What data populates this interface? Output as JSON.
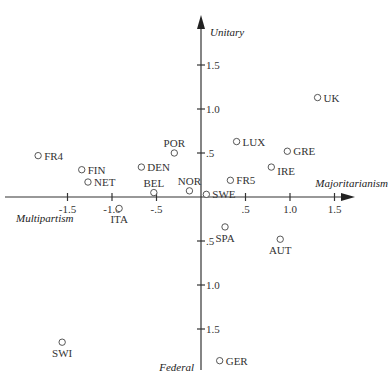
{
  "chart_data": {
    "type": "scatter",
    "title": "",
    "xlabel_positive": "Majoritarianism",
    "xlabel_negative": "Multipartism",
    "ylabel_positive": "Unitary",
    "ylabel_negative": "Federal",
    "xlim": [
      -1.9,
      1.7
    ],
    "ylim": [
      -1.95,
      2.05
    ],
    "grid": false,
    "legend": null,
    "x_ticks": [
      {
        "value": -1.5,
        "label": "-1.5"
      },
      {
        "value": -1.0,
        "label": "-1.0"
      },
      {
        "value": -0.5,
        "label": "-.5"
      },
      {
        "value": 0.5,
        "label": ".5"
      },
      {
        "value": 1.0,
        "label": "1.0"
      },
      {
        "value": 1.5,
        "label": "1.5"
      }
    ],
    "y_ticks": [
      {
        "value": 1.5,
        "label": "1.5"
      },
      {
        "value": 1.0,
        "label": "1.0"
      },
      {
        "value": 0.5,
        "label": ".5"
      },
      {
        "value": -0.5,
        "label": ".5"
      },
      {
        "value": -1.0,
        "label": "1.0"
      },
      {
        "value": -1.5,
        "label": "1.5"
      }
    ],
    "points": [
      {
        "label": "FR4",
        "x": -1.83,
        "y": 0.47,
        "label_pos": "right"
      },
      {
        "label": "FIN",
        "x": -1.34,
        "y": 0.31,
        "label_pos": "right"
      },
      {
        "label": "NET",
        "x": -1.27,
        "y": 0.17,
        "label_pos": "right"
      },
      {
        "label": "DEN",
        "x": -0.67,
        "y": 0.34,
        "label_pos": "right"
      },
      {
        "label": "POR",
        "x": -0.3,
        "y": 0.5,
        "label_pos": "above"
      },
      {
        "label": "BEL",
        "x": -0.53,
        "y": 0.05,
        "label_pos": "above"
      },
      {
        "label": "NOR",
        "x": -0.13,
        "y": 0.07,
        "label_pos": "above"
      },
      {
        "label": "ITA",
        "x": -0.92,
        "y": -0.13,
        "label_pos": "below"
      },
      {
        "label": "SWE",
        "x": 0.06,
        "y": 0.03,
        "label_pos": "right"
      },
      {
        "label": "LUX",
        "x": 0.4,
        "y": 0.63,
        "label_pos": "right"
      },
      {
        "label": "FR5",
        "x": 0.33,
        "y": 0.19,
        "label_pos": "right"
      },
      {
        "label": "IRE",
        "x": 0.79,
        "y": 0.34,
        "label_pos": "right-below"
      },
      {
        "label": "GRE",
        "x": 0.97,
        "y": 0.52,
        "label_pos": "right"
      },
      {
        "label": "UK",
        "x": 1.31,
        "y": 1.13,
        "label_pos": "right"
      },
      {
        "label": "SPA",
        "x": 0.27,
        "y": -0.34,
        "label_pos": "below"
      },
      {
        "label": "AUT",
        "x": 0.89,
        "y": -0.48,
        "label_pos": "below"
      },
      {
        "label": "SWI",
        "x": -1.56,
        "y": -1.65,
        "label_pos": "below"
      },
      {
        "label": "GER",
        "x": 0.21,
        "y": -1.86,
        "label_pos": "right"
      }
    ]
  },
  "layout": {
    "origin_px": [
      201,
      197
    ],
    "px_per_unit_x": 89,
    "px_per_unit_y": 88,
    "x_axis_px": [
      5,
      355
    ],
    "y_axis_px": [
      15,
      370
    ]
  }
}
